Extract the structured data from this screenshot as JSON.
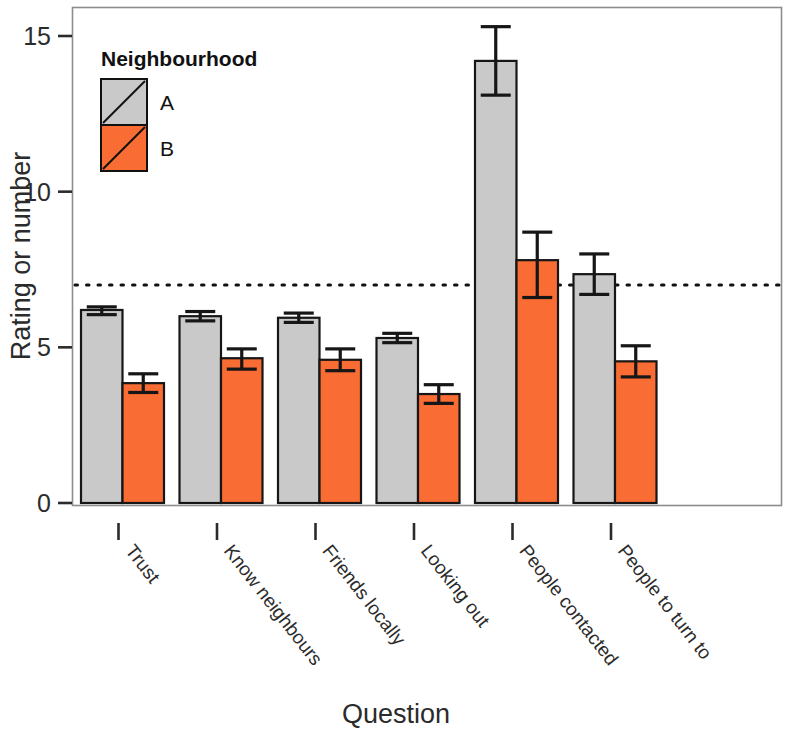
{
  "chart_data": {
    "type": "bar",
    "title": "",
    "xlabel": "Question",
    "ylabel": "Rating or number",
    "categories": [
      "Trust",
      "Know neighbours",
      "Friends locally",
      "Looking out",
      "People contacted",
      "People to turn to"
    ],
    "series": [
      {
        "name": "A",
        "color": "#c9c9c9",
        "values": [
          6.2,
          6.0,
          5.95,
          5.3,
          14.2,
          7.35
        ],
        "err_low": [
          6.05,
          5.85,
          5.8,
          5.15,
          13.1,
          6.7
        ],
        "err_high": [
          6.3,
          6.15,
          6.1,
          5.45,
          15.3,
          8.0
        ]
      },
      {
        "name": "B",
        "color": "#f96c33",
        "values": [
          3.85,
          4.65,
          4.6,
          3.5,
          7.8,
          4.55
        ],
        "err_low": [
          3.55,
          4.3,
          4.25,
          3.2,
          6.6,
          4.05
        ],
        "err_high": [
          4.15,
          4.95,
          4.95,
          3.8,
          8.7,
          5.05
        ]
      }
    ],
    "ylim": [
      0,
      15.9
    ],
    "yticks": [
      0,
      5,
      10,
      15
    ],
    "ytick_labels": [
      "0",
      "5",
      "10",
      "15"
    ],
    "grid": false,
    "reference_line": {
      "value": 7,
      "style": "dotted"
    },
    "legend": {
      "title": "Neighbourhood",
      "position": "top-left",
      "entries": [
        {
          "label": "A",
          "color": "#c9c9c9"
        },
        {
          "label": "B",
          "color": "#f96c33"
        }
      ]
    },
    "colors": {
      "series_a": "#c9c9c9",
      "series_b": "#f96c33",
      "axis": "#2b2b2b",
      "frame": "#8d8d8d",
      "outline": "#161616",
      "background": "#ffffff"
    }
  }
}
